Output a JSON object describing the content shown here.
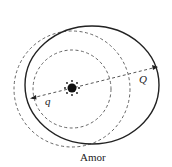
{
  "diagram": {
    "caption": "Amor",
    "labels": {
      "perihelion": "q",
      "aphelion": "Q"
    },
    "elements": {
      "sun": {
        "cx": 72,
        "cy": 88,
        "r": 4
      },
      "inner_orbit": {
        "style": "dashed",
        "r": 39
      },
      "outer_orbit": {
        "style": "dashed",
        "r": 58
      },
      "asteroid_orbit": {
        "style": "solid"
      }
    },
    "colors": {
      "line": "#222222",
      "background": "#ffffff"
    }
  }
}
